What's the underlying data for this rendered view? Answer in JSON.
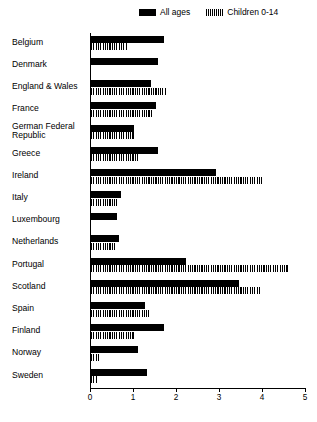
{
  "chart_data": {
    "type": "bar",
    "orientation": "horizontal",
    "title": "",
    "subtitle": "",
    "xlabel": "",
    "ylabel": "",
    "xlim": [
      0,
      5
    ],
    "xticks": [
      0,
      1,
      2,
      3,
      4,
      5
    ],
    "xtick_labels": [
      "0",
      "1",
      "2",
      "3",
      "4",
      "5"
    ],
    "grid": false,
    "legend_position": "top-right",
    "categories": [
      "Belgium",
      "Denmark",
      "England & Wales",
      "France",
      "German Federal\nRepublic",
      "Greece",
      "Ireland",
      "Italy",
      "Luxembourg",
      "Netherlands",
      "Portugal",
      "Scotland",
      "Spain",
      "Finland",
      "Norway",
      "Sweden"
    ],
    "series": [
      {
        "name": "All ages",
        "fill": "solid",
        "color": "#000000",
        "values": [
          1.7,
          1.55,
          1.4,
          1.5,
          1.0,
          1.55,
          2.9,
          0.7,
          0.6,
          0.65,
          2.2,
          3.45,
          1.25,
          1.7,
          1.1,
          1.3
        ]
      },
      {
        "name": "Children 0-14",
        "fill": "hatched",
        "color": "#000000",
        "values": [
          0.85,
          0.0,
          1.75,
          1.45,
          1.0,
          1.1,
          4.0,
          0.6,
          0.0,
          0.55,
          4.6,
          3.95,
          1.35,
          1.0,
          0.2,
          0.15
        ]
      }
    ]
  },
  "legend": {
    "entries": [
      {
        "label": "All ages",
        "swatch": "solid-swatch-icon"
      },
      {
        "label": "Children 0-14",
        "swatch": "hatched-swatch-icon"
      }
    ]
  }
}
